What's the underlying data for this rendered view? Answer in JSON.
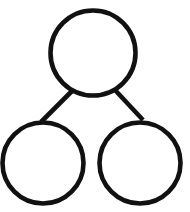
{
  "figure": {
    "kind": "number-bond-diagram",
    "background_color": "#ffffff",
    "stroke_color": "#111111",
    "fill_color": "#ffffff",
    "canvas": {
      "width": 190,
      "height": 212
    }
  },
  "chart_data": {
    "type": "diagram",
    "xlabel": "",
    "ylabel": "",
    "nodes": [
      {
        "id": "whole",
        "role": "whole",
        "label": "",
        "cx": 93,
        "cy": 53,
        "r": 42.5,
        "stroke": "#111111",
        "stroke_width": 4.6,
        "fill": "#ffffff"
      },
      {
        "id": "part-left",
        "role": "part",
        "label": "",
        "cx": 43,
        "cy": 163,
        "r": 40.5,
        "stroke": "#111111",
        "stroke_width": 4.6,
        "fill": "#ffffff"
      },
      {
        "id": "part-right",
        "role": "part",
        "label": "",
        "cx": 140,
        "cy": 163,
        "r": 40.5,
        "stroke": "#111111",
        "stroke_width": 4.6,
        "fill": "#ffffff"
      }
    ],
    "links": [
      {
        "id": "link-whole-left",
        "from": "whole",
        "to": "part-left",
        "x1": 72,
        "y1": 91,
        "x2": 41,
        "y2": 122,
        "stroke": "#111111",
        "stroke_width": 4.6
      },
      {
        "id": "link-whole-right",
        "from": "whole",
        "to": "part-right",
        "x1": 115,
        "y1": 90,
        "x2": 143,
        "y2": 120,
        "stroke": "#111111",
        "stroke_width": 4.6
      }
    ],
    "legend": [],
    "annotations": [],
    "grid": false
  }
}
